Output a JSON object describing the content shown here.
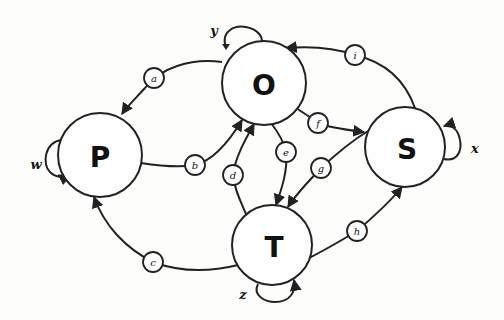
{
  "diagram": {
    "type": "state-transition-graph",
    "nodes": [
      {
        "id": "O",
        "label": "O"
      },
      {
        "id": "P",
        "label": "P"
      },
      {
        "id": "S",
        "label": "S"
      },
      {
        "id": "T",
        "label": "T"
      }
    ],
    "edges": [
      {
        "label": "a",
        "from": "O",
        "to": "P"
      },
      {
        "label": "b",
        "from": "P",
        "to": "O"
      },
      {
        "label": "c",
        "from": "T",
        "to": "P"
      },
      {
        "label": "d",
        "from": "T",
        "to": "O"
      },
      {
        "label": "e",
        "from": "O",
        "to": "T"
      },
      {
        "label": "f",
        "from": "O",
        "to": "S"
      },
      {
        "label": "g",
        "from": "S",
        "to": "T"
      },
      {
        "label": "h",
        "from": "T",
        "to": "S"
      },
      {
        "label": "i",
        "from": "S",
        "to": "O"
      }
    ],
    "self_loops": [
      {
        "label": "y",
        "node": "O"
      },
      {
        "label": "w",
        "node": "P"
      },
      {
        "label": "x",
        "node": "S"
      },
      {
        "label": "z",
        "node": "T"
      }
    ]
  }
}
